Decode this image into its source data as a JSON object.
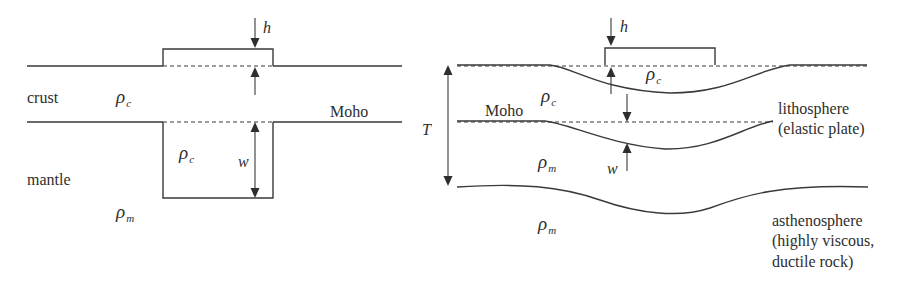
{
  "figure": {
    "left_panel": {
      "name": "Airy isostasy (local compensation)",
      "labels": {
        "crust": "crust",
        "mantle": "mantle",
        "moho": "Moho",
        "h": "h",
        "w": "w",
        "rho_c_crust": {
          "symbol": "ρ",
          "sub": "c"
        },
        "rho_c_root": {
          "symbol": "ρ",
          "sub": "c"
        },
        "rho_m": {
          "symbol": "ρ",
          "sub": "m"
        }
      }
    },
    "right_panel": {
      "name": "Flexural isostasy (regional compensation)",
      "labels": {
        "T": "T",
        "moho": "Moho",
        "h": "h",
        "w": "w",
        "rho_c_load": {
          "symbol": "ρ",
          "sub": "c"
        },
        "rho_c_plate": {
          "symbol": "ρ",
          "sub": "c"
        },
        "rho_m_plate": {
          "symbol": "ρ",
          "sub": "m"
        },
        "rho_m_asthenosphere": {
          "symbol": "ρ",
          "sub": "m"
        },
        "lithosphere_line1": "lithosphere",
        "lithosphere_line2": "(elastic plate)",
        "asthenosphere_line1": "asthenosphere",
        "asthenosphere_line2": "(highly viscous,",
        "asthenosphere_line3": "ductile rock)"
      }
    },
    "colors": {
      "line": "#3a3a3a",
      "text": "#2e2e2e",
      "background": "#ffffff"
    }
  }
}
